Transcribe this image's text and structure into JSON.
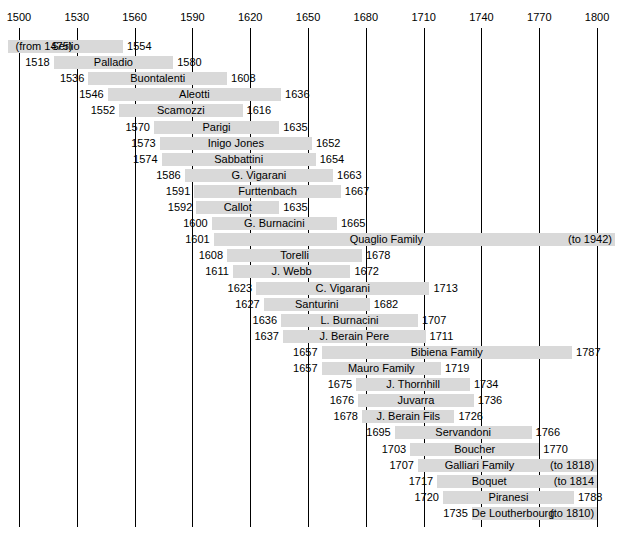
{
  "chart_data": {
    "type": "bar",
    "title": "",
    "xlabel": "",
    "ylabel": "",
    "orientation": "horizontal",
    "xlim": [
      1500,
      1800
    ],
    "axis_ticks": [
      1500,
      1530,
      1560,
      1590,
      1620,
      1650,
      1680,
      1710,
      1740,
      1770,
      1800
    ],
    "axis_tick_labels": [
      "1500",
      "1530",
      "1560",
      "1590",
      "1620",
      "1650",
      "1680",
      "1710",
      "1740",
      "1770",
      "1800"
    ],
    "grid": true,
    "legend": "none",
    "bar_color": "#d9d9d9",
    "rows": [
      {
        "name": "Serlio",
        "start": 1475,
        "end": 1554,
        "start_label": "(from 1475)",
        "end_label": "1554",
        "start_label_inside": true,
        "end_label_inside": false,
        "clip_left": true
      },
      {
        "name": "Palladio",
        "start": 1518,
        "end": 1580,
        "start_label": "1518",
        "end_label": "1580",
        "start_label_inside": false,
        "end_label_inside": false
      },
      {
        "name": "Buontalenti",
        "start": 1536,
        "end": 1608,
        "start_label": "1536",
        "end_label": "1608",
        "start_label_inside": false,
        "end_label_inside": false
      },
      {
        "name": "Aleotti",
        "start": 1546,
        "end": 1636,
        "start_label": "1546",
        "end_label": "1636",
        "start_label_inside": false,
        "end_label_inside": false
      },
      {
        "name": "Scamozzi",
        "start": 1552,
        "end": 1616,
        "start_label": "1552",
        "end_label": "1616",
        "start_label_inside": false,
        "end_label_inside": false
      },
      {
        "name": "Parigi",
        "start": 1570,
        "end": 1635,
        "start_label": "1570",
        "end_label": "1635",
        "start_label_inside": false,
        "end_label_inside": false
      },
      {
        "name": "Inigo Jones",
        "start": 1573,
        "end": 1652,
        "start_label": "1573",
        "end_label": "1652",
        "start_label_inside": false,
        "end_label_inside": false
      },
      {
        "name": "Sabbattini",
        "start": 1574,
        "end": 1654,
        "start_label": "1574",
        "end_label": "1654",
        "start_label_inside": false,
        "end_label_inside": false
      },
      {
        "name": "G. Vigarani",
        "start": 1586,
        "end": 1663,
        "start_label": "1586",
        "end_label": "1663",
        "start_label_inside": false,
        "end_label_inside": false
      },
      {
        "name": "Furttenbach",
        "start": 1591,
        "end": 1667,
        "start_label": "1591",
        "end_label": "1667",
        "start_label_inside": false,
        "end_label_inside": false
      },
      {
        "name": "Callot",
        "start": 1592,
        "end": 1635,
        "start_label": "1592",
        "end_label": "1635",
        "start_label_inside": false,
        "end_label_inside": false
      },
      {
        "name": "G. Burnacini",
        "start": 1600,
        "end": 1665,
        "start_label": "1600",
        "end_label": "1665",
        "start_label_inside": false,
        "end_label_inside": false
      },
      {
        "name": "Quaglio Family",
        "start": 1601,
        "end": 1810,
        "start_label": "1601",
        "end_label": "(to 1942)",
        "start_label_inside": false,
        "end_label_inside": true,
        "clip_right": true
      },
      {
        "name": "Torelli",
        "start": 1608,
        "end": 1678,
        "start_label": "1608",
        "end_label": "1678",
        "start_label_inside": false,
        "end_label_inside": false
      },
      {
        "name": "J. Webb",
        "start": 1611,
        "end": 1672,
        "start_label": "1611",
        "end_label": "1672",
        "start_label_inside": false,
        "end_label_inside": false
      },
      {
        "name": "C. Vigarani",
        "start": 1623,
        "end": 1713,
        "start_label": "1623",
        "end_label": "1713",
        "start_label_inside": false,
        "end_label_inside": false
      },
      {
        "name": "Santurini",
        "start": 1627,
        "end": 1682,
        "start_label": "1627",
        "end_label": "1682",
        "start_label_inside": false,
        "end_label_inside": false
      },
      {
        "name": "L. Burnacini",
        "start": 1636,
        "end": 1707,
        "start_label": "1636",
        "end_label": "1707",
        "start_label_inside": false,
        "end_label_inside": false
      },
      {
        "name": "J. Berain Pere",
        "start": 1637,
        "end": 1711,
        "start_label": "1637",
        "end_label": "1711",
        "start_label_inside": false,
        "end_label_inside": false
      },
      {
        "name": "Bibiena Family",
        "start": 1657,
        "end": 1787,
        "start_label": "1657",
        "end_label": "1787",
        "start_label_inside": false,
        "end_label_inside": false
      },
      {
        "name": "Mauro Family",
        "start": 1657,
        "end": 1719,
        "start_label": "1657",
        "end_label": "1719",
        "start_label_inside": false,
        "end_label_inside": false
      },
      {
        "name": "J. Thornhill",
        "start": 1675,
        "end": 1734,
        "start_label": "1675",
        "end_label": "1734",
        "start_label_inside": false,
        "end_label_inside": false
      },
      {
        "name": "Juvarra",
        "start": 1676,
        "end": 1736,
        "start_label": "1676",
        "end_label": "1736",
        "start_label_inside": false,
        "end_label_inside": false
      },
      {
        "name": "J. Berain Fils",
        "start": 1678,
        "end": 1726,
        "start_label": "1678",
        "end_label": "1726",
        "start_label_inside": false,
        "end_label_inside": false
      },
      {
        "name": "Servandoni",
        "start": 1695,
        "end": 1766,
        "start_label": "1695",
        "end_label": "1766",
        "start_label_inside": false,
        "end_label_inside": false
      },
      {
        "name": "Boucher",
        "start": 1703,
        "end": 1770,
        "start_label": "1703",
        "end_label": "1770",
        "start_label_inside": false,
        "end_label_inside": false
      },
      {
        "name": "Galliari Family",
        "start": 1707,
        "end": 1800,
        "start_label": "1707",
        "end_label": "(to 1818)",
        "start_label_inside": false,
        "end_label_inside": true
      },
      {
        "name": "Boquet",
        "start": 1717,
        "end": 1800,
        "start_label": "1717",
        "end_label": "(to 1814",
        "start_label_inside": false,
        "end_label_inside": true
      },
      {
        "name": "Piranesi",
        "start": 1720,
        "end": 1788,
        "start_label": "1720",
        "end_label": "1788",
        "start_label_inside": false,
        "end_label_inside": false
      },
      {
        "name": "De Loutherbourg",
        "start": 1735,
        "end": 1800,
        "start_label": "1735",
        "end_label": "(to 1810)",
        "start_label_inside": false,
        "end_label_inside": true
      }
    ]
  }
}
